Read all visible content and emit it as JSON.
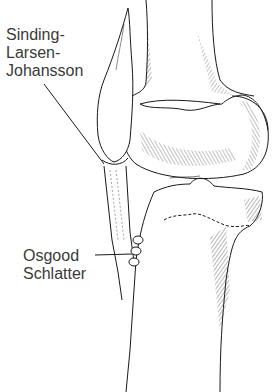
{
  "figure": {
    "labels": {
      "sinding_larsen_johansson": [
        "Sinding-",
        "Larsen-",
        "Johansson"
      ],
      "osgood_schlatter": [
        "Osgood",
        "Schlatter"
      ]
    },
    "structures": [
      "femur",
      "patella",
      "patellar-tendon",
      "tibia",
      "tibial-tuberosity-ossicles"
    ],
    "colors": {
      "line": "#1a1a1a",
      "hatch": "#333333",
      "text": "#3a3a3a",
      "background": "#ffffff"
    }
  }
}
